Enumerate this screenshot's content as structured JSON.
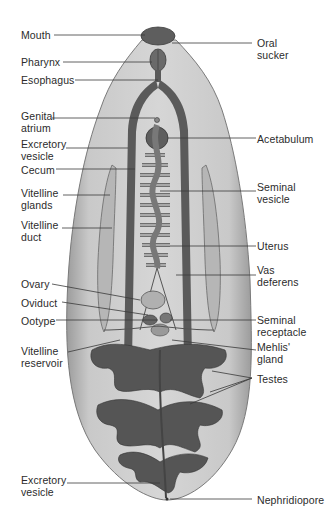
{
  "figure": {
    "colors": {
      "body_fill": "#c8c8c8",
      "body_edge": "#8a8a8a",
      "organ_dark": "#5a5a5a",
      "organ_mid": "#7a7a7a",
      "organ_light": "#b4b4b4",
      "leader_line": "#3a3a3a",
      "label_text": "#2b2b2b"
    }
  },
  "labels_left": [
    {
      "text": "Mouth"
    },
    {
      "text": "Pharynx"
    },
    {
      "text": "Esophagus"
    },
    {
      "text": "Genital\natrium"
    },
    {
      "text": "Excretory\nvesicle"
    },
    {
      "text": "Cecum"
    },
    {
      "text": "Vitelline\nglands"
    },
    {
      "text": "Vitelline\nduct"
    },
    {
      "text": "Ovary"
    },
    {
      "text": "Oviduct"
    },
    {
      "text": "Ootype"
    },
    {
      "text": "Vitelline\nreservoir"
    },
    {
      "text": "Excretory\nvesicle"
    }
  ],
  "labels_right": [
    {
      "text": "Oral\nsucker"
    },
    {
      "text": "Acetabulum"
    },
    {
      "text": "Seminal\nvesicle"
    },
    {
      "text": "Uterus"
    },
    {
      "text": "Vas\ndeferens"
    },
    {
      "text": "Seminal\nreceptacle"
    },
    {
      "text": "Mehlis'\ngland"
    },
    {
      "text": "Testes"
    },
    {
      "text": "Nephridiopore"
    }
  ]
}
